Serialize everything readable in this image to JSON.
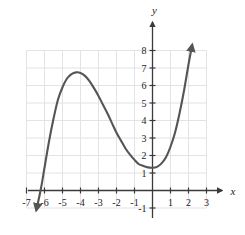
{
  "chart_data": {
    "type": "line",
    "title": "",
    "xlabel": "x",
    "ylabel": "y",
    "grid": true,
    "legend": null,
    "xlim": [
      -7,
      3
    ],
    "ylim": [
      -1,
      8
    ],
    "xticks": [
      -7,
      -6,
      -5,
      -4,
      -3,
      -2,
      -1,
      1,
      2,
      3
    ],
    "yticks": [
      -1,
      1,
      2,
      3,
      4,
      5,
      6,
      7,
      8
    ],
    "xtick_labels": [
      "-7",
      "-6",
      "-5",
      "-4",
      "-3",
      "-2",
      "-1",
      "1",
      "2",
      "3"
    ],
    "ytick_labels": [
      "-1",
      "1",
      "2",
      "3",
      "4",
      "5",
      "6",
      "7",
      "8"
    ],
    "series": [
      {
        "name": "cubic-curve",
        "color": "#555555",
        "arrow_start": true,
        "arrow_end": true,
        "x": [
          -6.45,
          -6.2,
          -6.0,
          -5.75,
          -5.5,
          -5.25,
          -5.0,
          -4.75,
          -4.5,
          -4.25,
          -4.0,
          -3.75,
          -3.5,
          -3.25,
          -3.0,
          -2.75,
          -2.5,
          -2.25,
          -2.0,
          -1.75,
          -1.5,
          -1.25,
          -1.0,
          -0.75,
          -0.5,
          -0.25,
          0.0,
          0.25,
          0.5,
          0.75,
          1.0,
          1.25,
          1.5,
          1.75,
          2.0,
          2.2
        ],
        "y": [
          -1.1,
          0.1,
          1.3,
          2.8,
          4.1,
          5.2,
          5.9,
          6.4,
          6.65,
          6.75,
          6.72,
          6.55,
          6.25,
          5.85,
          5.4,
          4.9,
          4.4,
          3.85,
          3.3,
          2.85,
          2.4,
          2.05,
          1.75,
          1.5,
          1.4,
          1.32,
          1.3,
          1.35,
          1.55,
          1.9,
          2.5,
          3.3,
          4.4,
          5.7,
          7.2,
          8.3
        ]
      }
    ],
    "features": {
      "local_max": {
        "x": -4.0,
        "y": 6.75
      },
      "local_min": {
        "x": 0.1,
        "y": 1.3
      },
      "x_intercept": {
        "x": -6.2,
        "y": 0
      },
      "y_intercept": {
        "x": 0,
        "y": 1.3
      }
    },
    "colors": {
      "curve": "#555555",
      "axis": "#3a3a3a",
      "grid": "#e2e2e8",
      "text": "#222222",
      "background": "#ffffff"
    }
  }
}
